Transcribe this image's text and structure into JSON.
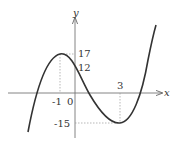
{
  "graph": {
    "function": "f(x) = x^3 - 3x^2 - 9x + 12",
    "x_axis_label": "x",
    "y_axis_label": "y",
    "origin_label": "0",
    "labels": {
      "x_neg1": "-1",
      "x_3": "3",
      "y_17": "17",
      "y_12": "12",
      "y_neg15": "-15"
    },
    "local_max": {
      "x": -1,
      "y": 17
    },
    "local_min": {
      "x": 3,
      "y": -15
    },
    "y_intercept": 12,
    "curve_color": "#333333",
    "axis_color": "#666666"
  }
}
